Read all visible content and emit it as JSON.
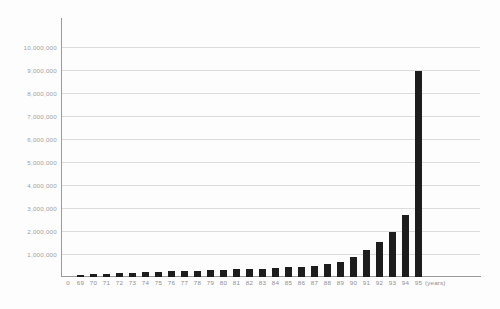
{
  "chart_data": {
    "type": "bar",
    "title": "",
    "xlabel": "(years)",
    "ylabel": "",
    "grid": true,
    "legend": false,
    "ylim": [
      0,
      10000000
    ],
    "y_ticks": [
      1000000,
      2000000,
      3000000,
      4000000,
      5000000,
      6000000,
      7000000,
      8000000,
      9000000,
      10000000
    ],
    "y_tick_labels": [
      "1,000,000",
      "2,000,000",
      "3,000,000",
      "4,000,000",
      "5,000,000",
      "6,000,000",
      "7,000,000",
      "8,000,000",
      "9,000,000",
      "10,000,000"
    ],
    "origin_label": "0",
    "x_units_label": "(years)",
    "categories": [
      "69",
      "70",
      "71",
      "72",
      "73",
      "74",
      "75",
      "76",
      "77",
      "78",
      "79",
      "80",
      "81",
      "82",
      "83",
      "84",
      "85",
      "86",
      "87",
      "88",
      "89",
      "90",
      "91",
      "92",
      "93",
      "94",
      "95"
    ],
    "values": [
      90000,
      130000,
      150000,
      180000,
      190000,
      200000,
      230000,
      260000,
      270000,
      280000,
      290000,
      300000,
      330000,
      350000,
      360000,
      390000,
      420000,
      450000,
      490000,
      560000,
      650000,
      870000,
      1180000,
      1540000,
      1950000,
      2700000,
      8950000
    ],
    "series_color": "#1d1d1d",
    "grid_color": "#dcdcdc",
    "axis_color": "#9a9a9a",
    "label_color": "#9d9d9d",
    "background": "#fdfdfd"
  }
}
